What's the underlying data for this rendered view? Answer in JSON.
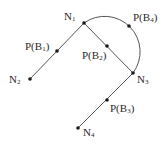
{
  "diagram": {
    "type": "graph",
    "colors": {
      "edge": "#555555",
      "node": "#1a1a1a",
      "text": "#2a2a2a",
      "background": "#ffffff"
    },
    "nodes": [
      {
        "id": "N1",
        "base": "N",
        "sub": "1",
        "x": 84,
        "y": 23,
        "label_x": 64,
        "label_y": 11
      },
      {
        "id": "N2",
        "base": "N",
        "sub": "2",
        "x": 30,
        "y": 79,
        "label_x": 9,
        "label_y": 74
      },
      {
        "id": "N3",
        "base": "N",
        "sub": "3",
        "x": 133,
        "y": 73,
        "label_x": 137,
        "label_y": 74
      },
      {
        "id": "N4",
        "base": "N",
        "sub": "4",
        "x": 78,
        "y": 128,
        "label_x": 83,
        "label_y": 127
      }
    ],
    "points": [
      {
        "id": "P(B1)",
        "base": "P(B",
        "sub": "1",
        "close": ")",
        "x": 57,
        "y": 51,
        "label_x": 25,
        "label_y": 41
      },
      {
        "id": "P(B2)",
        "base": "P(B",
        "sub": "2",
        "close": ")",
        "x": 107,
        "y": 46,
        "label_x": 82,
        "label_y": 50
      },
      {
        "id": "P(B3)",
        "base": "P(B",
        "sub": "3",
        "close": ")",
        "x": 107,
        "y": 100,
        "label_x": 110,
        "label_y": 103
      },
      {
        "id": "P(B4)",
        "base": "P(B",
        "sub": "4",
        "close": ")",
        "x": 129,
        "y": 26,
        "label_x": 133,
        "label_y": 12
      }
    ],
    "edges": [
      {
        "from": "N1",
        "to": "N2",
        "via": "P(B1)",
        "shape": "line"
      },
      {
        "from": "N1",
        "to": "N3",
        "via": "P(B2)",
        "shape": "line"
      },
      {
        "from": "N3",
        "to": "N4",
        "via": "P(B3)",
        "shape": "line"
      },
      {
        "from": "N1",
        "to": "N3",
        "via": "P(B4)",
        "shape": "arc"
      }
    ]
  }
}
